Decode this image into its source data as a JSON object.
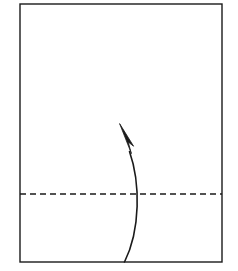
{
  "diagram": {
    "kind": "origami-fold-instruction",
    "canvas": {
      "width": 238,
      "height": 271,
      "background": "#ffffff"
    },
    "colors": {
      "outline": "#1a1a1a",
      "fold_line": "#1a1a1a",
      "arrow": "#1a1a1a",
      "paper_fill": "#ffffff"
    },
    "paper_sheet": {
      "name": "paper-sheet",
      "shape": "rectangle",
      "x": 20,
      "y": 4,
      "width": 202,
      "height": 258,
      "stroke_width": 1.4,
      "fill": "#ffffff"
    },
    "fold_line": {
      "name": "horizontal-fold-line",
      "style": "dashed",
      "orientation": "horizontal",
      "x1": 20,
      "y1": 194,
      "x2": 222,
      "y2": 194,
      "stroke_width": 1.4,
      "dash": 6,
      "gap": 4
    },
    "fold_arrow": {
      "name": "fold-direction-arrow",
      "direction": "up-left",
      "curve": "M 124,262 C 141,228 140,182 130,152",
      "stroke_width": 1.6,
      "tip_x": 120,
      "tip_y": 124,
      "head_points": "120,124 133,145 128.5,141.5 130.5,152.5",
      "head_length": 28
    }
  }
}
